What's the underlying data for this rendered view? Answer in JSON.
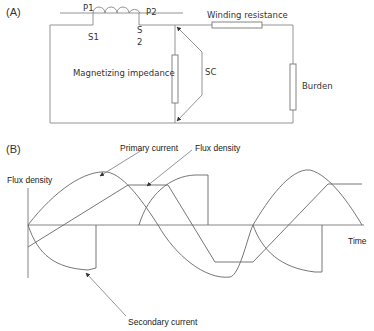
{
  "panel_a": {
    "label": "(A)",
    "terminals": {
      "p1": "P1",
      "p2": "P2",
      "s1": "S1",
      "s2_top": "S",
      "s2_bottom": "2"
    },
    "components": {
      "magnetizing_impedance": "Magnetizing impedance",
      "sc": "SC",
      "winding_resistance": "Winding resistance",
      "burden": "Burden"
    }
  },
  "panel_b": {
    "label": "(B)",
    "y_axis_label": "Flux density",
    "x_axis_label": "Time",
    "annotations": {
      "primary_current": "Primary current",
      "flux_density": "Flux density",
      "secondary_current": "Secondary current"
    }
  },
  "colors": {
    "line": "#777777",
    "text": "#333333",
    "background": "#ffffff"
  }
}
